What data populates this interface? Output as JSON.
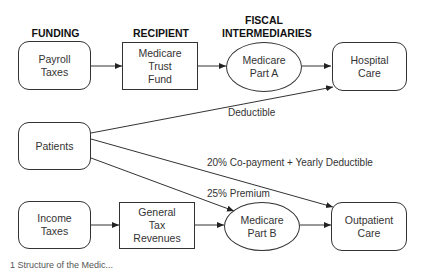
{
  "headers": {
    "funding": "FUNDING",
    "recipient": "RECIPIENT",
    "fiscal": "FISCAL\nINTERMEDIARIES"
  },
  "nodes": {
    "payroll_taxes": "Payroll\nTaxes",
    "medicare_trust_fund": "Medicare\nTrust\nFund",
    "medicare_part_a": "Medicare\nPart A",
    "hospital_care": "Hospital\nCare",
    "patients": "Patients",
    "income_taxes": "Income\nTaxes",
    "general_tax_revenues": "General\nTax\nRevenues",
    "medicare_part_b": "Medicare\nPart B",
    "outpatient_care": "Outpatient\nCare"
  },
  "edge_labels": {
    "deductible": "Deductible",
    "copayment": "20% Co-payment + Yearly Deductible",
    "premium": "25% Premium"
  },
  "caption": "1    Structure of the Medic..."
}
